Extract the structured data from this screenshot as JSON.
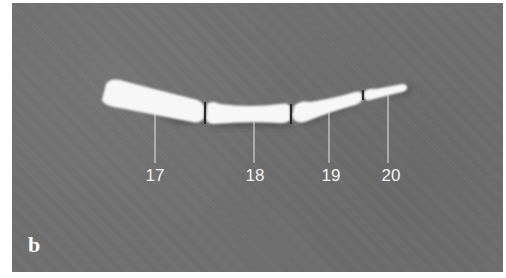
{
  "figure": {
    "panel_label": "b",
    "background_color": "#6f6f6f",
    "bone_color": "#f7f7f7",
    "callouts": [
      {
        "label": "17",
        "x": 155,
        "line_top": 112,
        "line_bottom": 163,
        "text_y": 166
      },
      {
        "label": "18",
        "x": 254,
        "line_top": 122,
        "line_bottom": 163,
        "text_y": 166
      },
      {
        "label": "19",
        "x": 329,
        "line_top": 112,
        "line_bottom": 163,
        "text_y": 166
      },
      {
        "label": "20",
        "x": 388,
        "line_top": 95,
        "line_bottom": 163,
        "text_y": 166
      }
    ]
  }
}
